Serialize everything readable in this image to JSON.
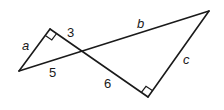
{
  "diagram": {
    "labels": {
      "a": "a",
      "three": "3",
      "five": "5",
      "six": "6",
      "b": "b",
      "c": "c"
    },
    "colors": {
      "stroke": "#1a1a1a",
      "background": "#ffffff"
    }
  }
}
